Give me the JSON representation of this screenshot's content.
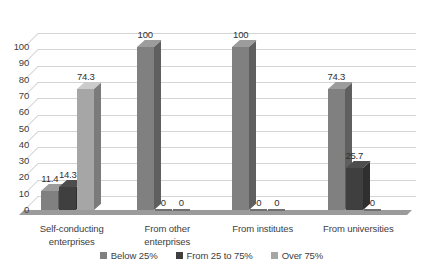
{
  "chart_data": {
    "type": "bar",
    "title": "",
    "subtitle": "",
    "xlabel": "",
    "ylabel": "",
    "ylim": [
      0,
      100
    ],
    "ytick_step": 10,
    "yticks": [
      "100",
      "90",
      "80",
      "70",
      "60",
      "50",
      "40",
      "30",
      "20",
      "10",
      "0"
    ],
    "grid": true,
    "legend_position": "bottom",
    "three_d": true,
    "categories": [
      "Self-conducting enterprises",
      "From other enterprises",
      "From institutes",
      "From universities"
    ],
    "category_lines": [
      [
        "Self-conducting",
        "enterprises"
      ],
      [
        "From other",
        "enterprises"
      ],
      [
        "From institutes"
      ],
      [
        "From universities"
      ]
    ],
    "series": [
      {
        "name": "Below 25%",
        "color": "#808080",
        "values": [
          11.4,
          100,
          100,
          74.3
        ],
        "labels": [
          "11.4",
          "100",
          "100",
          "74.3"
        ]
      },
      {
        "name": "From 25 to 75%",
        "color": "#3f3f3f",
        "values": [
          14.3,
          0,
          0,
          25.7
        ],
        "labels": [
          "14.3",
          "0",
          "0",
          "25.7"
        ]
      },
      {
        "name": "Over 75%",
        "color": "#a6a6a6",
        "values": [
          74.3,
          0,
          0,
          0
        ],
        "labels": [
          "74.3",
          "0",
          "0",
          "0"
        ]
      }
    ]
  },
  "colors": {
    "gridline": "#d4d4d4",
    "text": "#404040",
    "background": "#ffffff",
    "floor": "#8a8a8a"
  }
}
